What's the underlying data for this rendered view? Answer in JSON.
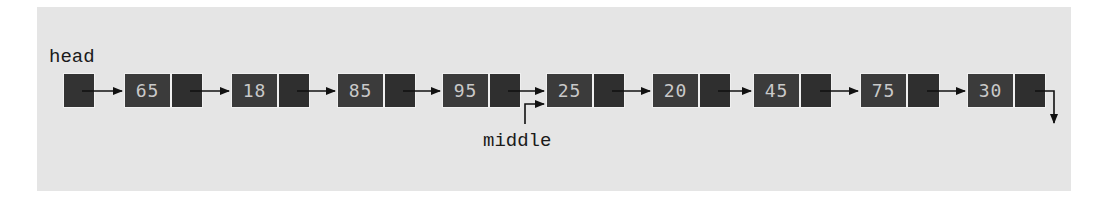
{
  "diagram": {
    "type": "singly-linked-list",
    "labels": {
      "head": "head",
      "middle": "middle"
    },
    "nodes": [
      {
        "value": "65"
      },
      {
        "value": "18"
      },
      {
        "value": "85"
      },
      {
        "value": "95"
      },
      {
        "value": "25"
      },
      {
        "value": "20"
      },
      {
        "value": "45"
      },
      {
        "value": "75"
      },
      {
        "value": "30"
      }
    ],
    "middle_points_to_index": 4,
    "last_next": "null",
    "colors": {
      "background": "#e5e5e5",
      "node_fill": "#3b3b3b",
      "pointer_fill": "#2f2f2f",
      "node_text": "#c9c9c9",
      "arrow": "#111111"
    }
  }
}
